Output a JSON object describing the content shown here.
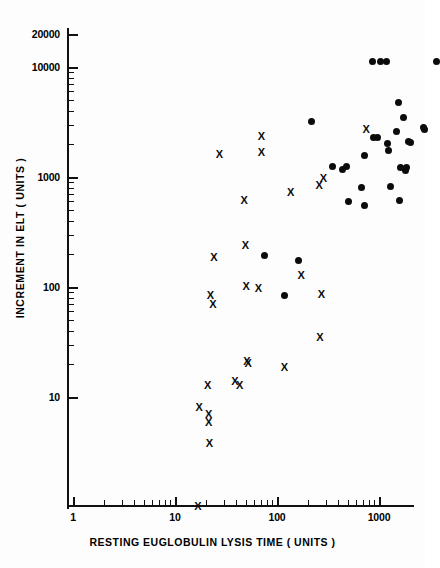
{
  "chart_data": {
    "type": "scatter",
    "title": "",
    "xlabel": "RESTING  EUGLOBULIN  LYSIS  TIME  ( UNITS )",
    "ylabel": "INCREMENT  IN  ELT  ( UNITS )",
    "xscale": "log",
    "yscale": "log",
    "xlim": [
      1,
      1000
    ],
    "ylim": [
      1.6,
      24000
    ],
    "x_ticks": [
      "1",
      "10",
      "100",
      "1000"
    ],
    "x_tick_values": [
      1,
      10,
      100,
      1000
    ],
    "y_ticks": [
      "10",
      "100",
      "1000",
      "10000",
      "20000"
    ],
    "y_tick_values": [
      10,
      100,
      1000,
      10000,
      20000
    ],
    "grid": false,
    "legend": "none",
    "series": [
      {
        "name": "cross-group",
        "marker": "x",
        "color": "#0b0b0b",
        "points": [
          [
            3.7,
            1.8
          ],
          [
            3.8,
            14.5
          ],
          [
            4.6,
            23
          ],
          [
            4.7,
            12.5
          ],
          [
            4.7,
            10.5
          ],
          [
            4.8,
            6.8
          ],
          [
            4.9,
            150
          ],
          [
            5.2,
            125
          ],
          [
            5.3,
            330
          ],
          [
            6.0,
            2900
          ],
          [
            8.5,
            25
          ],
          [
            9.5,
            23
          ],
          [
            10.5,
            1100
          ],
          [
            10.8,
            430
          ],
          [
            11.0,
            180
          ],
          [
            11.2,
            38
          ],
          [
            11.5,
            36
          ],
          [
            14.5,
            175
          ],
          [
            15.5,
            4200
          ],
          [
            15.5,
            3000
          ],
          [
            26,
            33
          ],
          [
            30,
            1300
          ],
          [
            38,
            230
          ],
          [
            57,
            1500
          ],
          [
            58,
            62
          ],
          [
            60,
            155
          ],
          [
            63,
            1750
          ],
          [
            165,
            4900
          ]
        ]
      },
      {
        "name": "dot-group",
        "marker": "o",
        "color": "#0b0b0b",
        "points": [
          [
            16.5,
            350
          ],
          [
            26,
            150
          ],
          [
            36,
            310
          ],
          [
            48,
            5700
          ],
          [
            78,
            2250
          ],
          [
            97,
            2100
          ],
          [
            105,
            2250
          ],
          [
            110,
            1080
          ],
          [
            150,
            1450
          ],
          [
            158,
            1000
          ],
          [
            160,
            2800
          ],
          [
            190,
            20000
          ],
          [
            195,
            4100
          ],
          [
            215,
            4100
          ],
          [
            230,
            20000
          ],
          [
            262,
            20000
          ],
          [
            270,
            3600
          ],
          [
            275,
            3100
          ],
          [
            285,
            1480
          ],
          [
            330,
            4700
          ],
          [
            345,
            8500
          ],
          [
            350,
            1100
          ],
          [
            360,
            2200
          ],
          [
            380,
            6200
          ],
          [
            400,
            2050
          ],
          [
            410,
            2200
          ],
          [
            425,
            3800
          ],
          [
            445,
            3700
          ],
          [
            600,
            5100
          ],
          [
            620,
            4900
          ],
          [
            800,
            20000
          ]
        ]
      }
    ]
  },
  "axes": {
    "x_label_text": "RESTING  EUGLOBULIN  LYSIS  TIME  ( UNITS )",
    "y_label_text": "INCREMENT  IN  ELT  ( UNITS )",
    "x_tick_labels": [
      "1",
      "10",
      "100",
      "1000"
    ],
    "y_tick_labels": [
      "20000",
      "10000",
      "1000",
      "100",
      "10"
    ]
  }
}
